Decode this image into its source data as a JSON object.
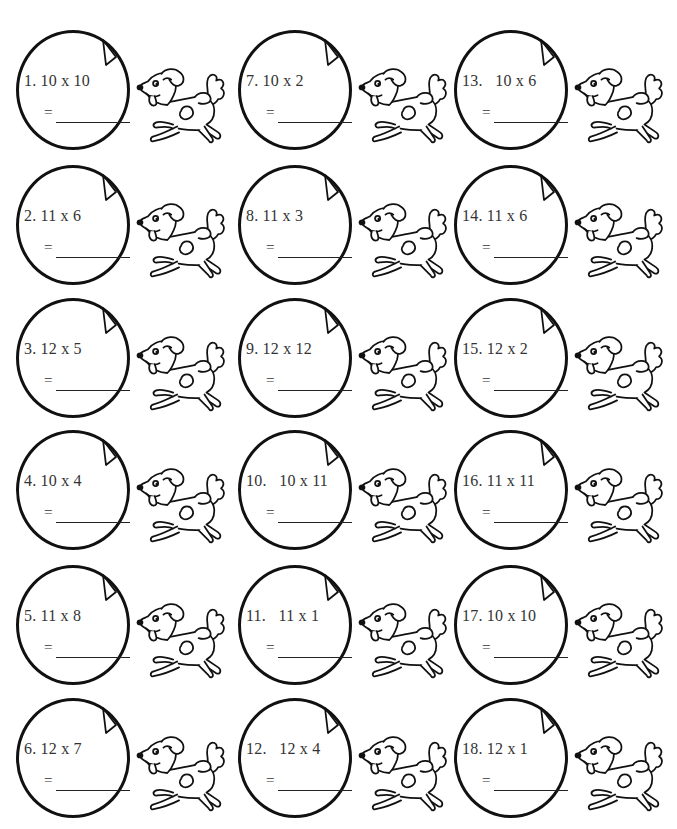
{
  "worksheet": {
    "topline_fragment": "",
    "problems": [
      {
        "number": "1.",
        "expression": "1. 10 x 10",
        "equals": "=",
        "answer": ""
      },
      {
        "number": "2.",
        "expression": "2. 11 x 6",
        "equals": "=",
        "answer": ""
      },
      {
        "number": "3.",
        "expression": "3. 12 x 5",
        "equals": "=",
        "answer": ""
      },
      {
        "number": "4.",
        "expression": "4. 10 x 4",
        "equals": "=",
        "answer": ""
      },
      {
        "number": "5.",
        "expression": "5. 11 x 8",
        "equals": "=",
        "answer": ""
      },
      {
        "number": "6.",
        "expression": "6. 12 x 7",
        "equals": "=",
        "answer": ""
      },
      {
        "number": "7.",
        "expression": "7. 10 x 2",
        "equals": "=",
        "answer": ""
      },
      {
        "number": "8.",
        "expression": "8. 11 x 3",
        "equals": "=",
        "answer": ""
      },
      {
        "number": "9.",
        "expression": "9. 12 x 12",
        "equals": "=",
        "answer": ""
      },
      {
        "number": "10.",
        "expression": "10.   10 x 11",
        "equals": "=",
        "answer": ""
      },
      {
        "number": "11.",
        "expression": "11.   11 x 1",
        "equals": "=",
        "answer": ""
      },
      {
        "number": "12.",
        "expression": "12.   12 x 4",
        "equals": "=",
        "answer": ""
      },
      {
        "number": "13.",
        "expression": "13.   10 x 6",
        "equals": "=",
        "answer": ""
      },
      {
        "number": "14.",
        "expression": "14. 11 x 6",
        "equals": "=",
        "answer": ""
      },
      {
        "number": "15.",
        "expression": "15. 12 x 2",
        "equals": "=",
        "answer": ""
      },
      {
        "number": "16.",
        "expression": "16. 11 x 11",
        "equals": "=",
        "answer": ""
      },
      {
        "number": "17.",
        "expression": "17. 10 x 10",
        "equals": "=",
        "answer": ""
      },
      {
        "number": "18.",
        "expression": "18. 12 x 1",
        "equals": "=",
        "answer": ""
      }
    ],
    "icons": {
      "circle_flag": "paper-corner-triangle-icon",
      "mascot": "running-dog-icon"
    },
    "colors": {
      "ink": "#111111",
      "text": "#333333",
      "paper": "#ffffff"
    }
  }
}
